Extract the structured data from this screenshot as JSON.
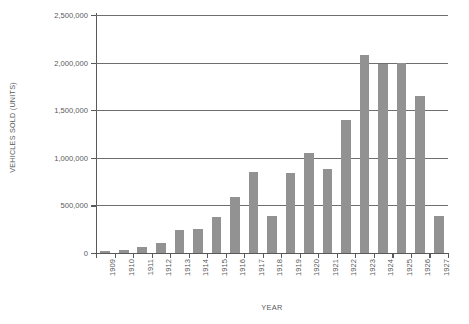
{
  "chart_data": {
    "type": "bar",
    "title": "",
    "xlabel": "YEAR",
    "ylabel": "VEHICLES SOLD (UNITS)",
    "ylim": [
      0,
      2500000
    ],
    "yticks": [
      0,
      500000,
      1000000,
      1500000,
      2000000,
      2500000
    ],
    "ytick_labels": [
      "0",
      "500,000",
      "1,000,000",
      "1,500,000",
      "2,000,000",
      "2,500,000"
    ],
    "grid": true,
    "legend": "none",
    "bar_color": "#929292",
    "axis_color": "#58595b",
    "categories": [
      "1909",
      "1910",
      "1911",
      "1912",
      "1913",
      "1914",
      "1915",
      "1916",
      "1917",
      "1918",
      "1919",
      "1920",
      "1921",
      "1922",
      "1923",
      "1924",
      "1925",
      "1926",
      "1927"
    ],
    "values": [
      20000,
      30000,
      60000,
      100000,
      240000,
      250000,
      380000,
      590000,
      850000,
      390000,
      840000,
      1050000,
      880000,
      1400000,
      2080000,
      1990000,
      2000000,
      1650000,
      390000
    ]
  }
}
